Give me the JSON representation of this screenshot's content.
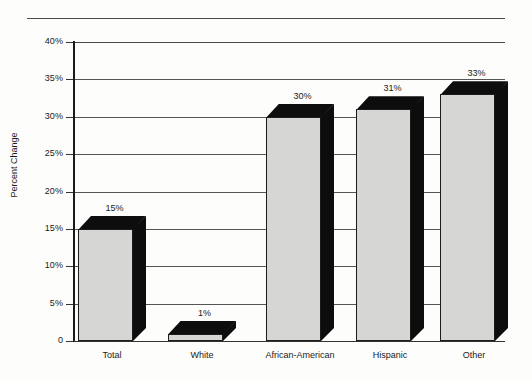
{
  "chart_data": {
    "type": "bar",
    "title": "",
    "subtitle": "",
    "xlabel": "",
    "ylabel": "Percent Change",
    "categories": [
      "Total",
      "White",
      "African-American",
      "Hispanic",
      "Other"
    ],
    "values": [
      15,
      1,
      30,
      31,
      33
    ],
    "value_labels": [
      "15%",
      "1%",
      "30%",
      "31%",
      "33%"
    ],
    "ylim": [
      0,
      40
    ],
    "ytick_values": [
      0,
      5,
      10,
      15,
      20,
      25,
      30,
      35,
      40
    ],
    "ytick_labels": [
      "0",
      "5%",
      "10%",
      "15%",
      "20%",
      "25%",
      "30%",
      "35%",
      "40%"
    ],
    "grid": true,
    "grid_axis": "y",
    "legend": false,
    "legend_position": "none",
    "style": "3d-bar",
    "colors": {
      "bar_front": "#d6d6d4",
      "bar_shadow": "#0d0d0d",
      "gridline": "#555555",
      "axis": "#1a1a1a",
      "text": "#1a1a1a",
      "background": "#fdfdfb"
    }
  },
  "decor": {
    "top_rule": ""
  }
}
